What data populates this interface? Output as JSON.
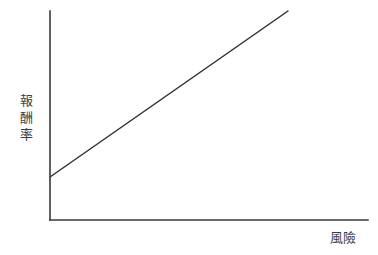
{
  "chart_data": {
    "type": "line",
    "title": "",
    "subtitle": "",
    "xlabel": "風險",
    "ylabel": "報酬率",
    "ylabel_chars": [
      "報",
      "酬",
      "率"
    ],
    "grid": false,
    "legend": null,
    "legend_position": "none",
    "axis_color": "#3a3a3a",
    "line_color": "#2f2f2f",
    "background_color": "#ffffff",
    "xlim": [
      0,
      1
    ],
    "ylim": [
      0,
      1
    ],
    "xticks": [],
    "yticks": [],
    "xticklabels": [],
    "yticklabels": [],
    "annotations": [],
    "series": [
      {
        "name": "風險報酬關係",
        "x": [
          0,
          1
        ],
        "y": [
          0.206,
          1.0
        ],
        "description": "正斜率直線，起點在縱軸上方非原點處"
      }
    ],
    "geometry": {
      "plot_origin_px": [
        50,
        220
      ],
      "y_axis_top_px": [
        50,
        11
      ],
      "x_axis_right_px": [
        368,
        220
      ],
      "line_start_px": [
        50,
        177
      ],
      "line_end_px": [
        288,
        11
      ]
    }
  }
}
